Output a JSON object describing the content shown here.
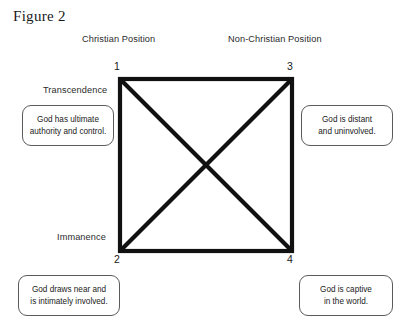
{
  "figure": {
    "title": "Figure 2",
    "columns": {
      "left": "Christian Position",
      "right": "Non-Christian Position"
    },
    "axis_labels": {
      "top": "Transcendence",
      "bottom": "Immanence"
    },
    "corners": {
      "top_left": "1",
      "top_right": "3",
      "bottom_left": "2",
      "bottom_right": "4"
    },
    "callouts": {
      "top_left": {
        "line1": "God has ultimate",
        "line2": "authority and control."
      },
      "top_right": {
        "line1": "God is distant",
        "line2": "and uninvolved."
      },
      "bottom_left": {
        "line1": "God draws near and",
        "line2": "is intimately involved."
      },
      "bottom_right": {
        "line1": "God is captive",
        "line2": "in the world."
      }
    },
    "colors": {
      "line": "#111111",
      "box_border": "#5b5b5b",
      "text": "#222222",
      "background": "#ffffff"
    }
  }
}
